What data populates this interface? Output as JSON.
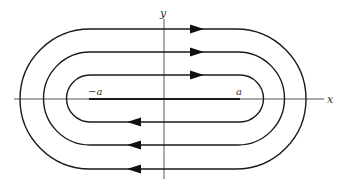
{
  "diagram": {
    "type": "flow-field-loops",
    "axes": {
      "x_label": "x",
      "y_label": "y"
    },
    "segment": {
      "left_label": "−a",
      "right_label": "a"
    },
    "loops": [
      {
        "name": "inner",
        "direction": "clockwise"
      },
      {
        "name": "middle",
        "direction": "clockwise"
      },
      {
        "name": "outer",
        "direction": "clockwise"
      }
    ],
    "colors": {
      "stroke": "#1a1a1a",
      "axis": "#444444"
    }
  }
}
